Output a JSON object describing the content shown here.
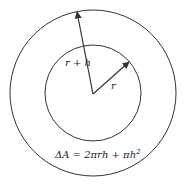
{
  "diagram": {
    "labels": {
      "outer_radius": "r + h",
      "inner_radius": "r",
      "formula_main": "ΔA = 2πrh + πh",
      "formula_exp": "2"
    },
    "colors": {
      "stroke": "#333333",
      "background": "#ffffff"
    }
  }
}
